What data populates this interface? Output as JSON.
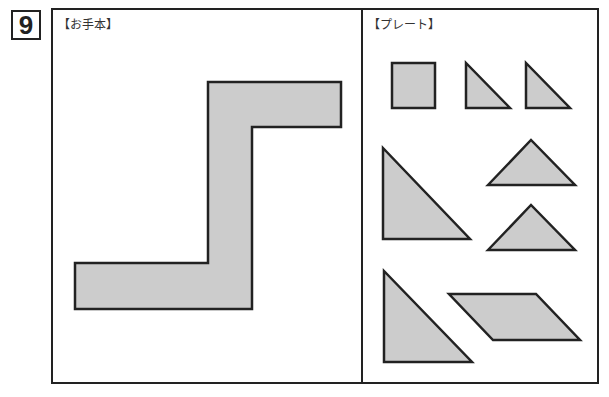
{
  "question": {
    "number": "9"
  },
  "panels": {
    "model": {
      "label": "【お手本】",
      "shape": {
        "name": "z-shaped-figure",
        "points": "208,82 341,82 341,127 252,127 252,309 75,309 75,263 208,263"
      }
    },
    "plates": {
      "label": "【プレート】",
      "pieces": [
        {
          "name": "square-piece",
          "points": "392,63 435,63 435,108 392,108"
        },
        {
          "name": "small-triangle-piece-1",
          "points": "466,63 466,108 510,108"
        },
        {
          "name": "small-triangle-piece-2",
          "points": "526,63 526,108 570,108"
        },
        {
          "name": "large-triangle-piece-1",
          "points": "383,148 383,239 470,239"
        },
        {
          "name": "medium-triangle-piece-1",
          "points": "488,185 531,140 575,185"
        },
        {
          "name": "medium-triangle-piece-2",
          "points": "488,250 531,205 575,250"
        },
        {
          "name": "large-triangle-piece-2",
          "points": "384,271 384,362 472,362"
        },
        {
          "name": "parallelogram-piece",
          "points": "449,294 536,294 580,340 493,340"
        }
      ]
    }
  },
  "colors": {
    "fill": "#cccccc",
    "stroke": "#222222"
  }
}
